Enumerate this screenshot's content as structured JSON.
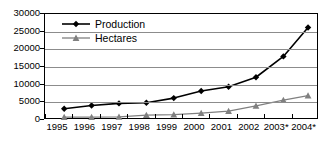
{
  "chart_data": {
    "type": "line",
    "title": "",
    "subtitle": "",
    "xlabel": "",
    "ylabel": "",
    "grid": true,
    "legend_position": "top-left",
    "xlim": [
      0,
      10
    ],
    "ylim": [
      0,
      30000
    ],
    "ytick_step": 5000,
    "ytick_labels": [
      "30000",
      "25000",
      "20000",
      "15000",
      "10000",
      "5000",
      "0"
    ],
    "ytick_values": [
      30000,
      25000,
      20000,
      15000,
      10000,
      5000,
      0
    ],
    "xtick_labels": [
      "1995",
      "1996",
      "1997",
      "1998",
      "1999",
      "2000",
      "2001",
      "2002",
      "2003*",
      "2004*"
    ],
    "categories": [
      "1996",
      "1997",
      "1998",
      "1999",
      "2000",
      "2001",
      "2002",
      "2003*",
      "2004*"
    ],
    "point_x_positions": [
      0.7,
      1.7,
      2.7,
      3.7,
      4.7,
      5.7,
      6.7,
      7.7,
      8.7
    ],
    "series": [
      {
        "name": "Production",
        "color": "#000000",
        "marker": "diamond",
        "values": [
          3200,
          4100,
          4700,
          4900,
          6200,
          8200,
          9400,
          12100,
          18000
        ]
      },
      {
        "name": "Hectares",
        "color": "#808080",
        "marker": "triangle",
        "values": [
          800,
          800,
          900,
          1400,
          1500,
          1950,
          2500,
          4000,
          5600
        ]
      }
    ],
    "extra_point": {
      "note": "final point plotted past last tick",
      "x": 9.6,
      "production": 26200,
      "hectares": 6900
    }
  },
  "legend": {
    "entries": [
      {
        "label": "Production",
        "color": "#000000",
        "marker": "diamond"
      },
      {
        "label": "Hectares",
        "color": "#808080",
        "marker": "triangle"
      }
    ]
  },
  "colors": {
    "production": "#000000",
    "hectares": "#808080",
    "gridline": "#8c8c8c",
    "frame": "#000000",
    "background": "#ffffff"
  }
}
